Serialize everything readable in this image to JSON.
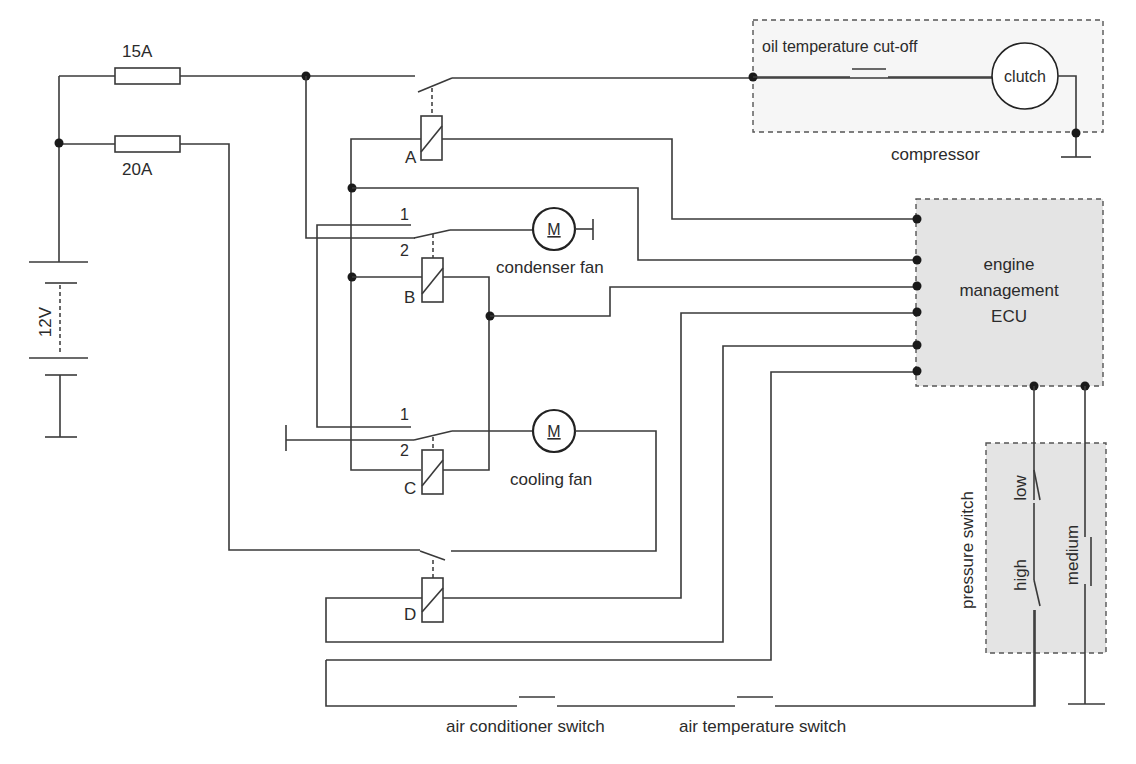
{
  "diagram": {
    "type": "wiring-schematic"
  },
  "power": {
    "battery_label": "12V",
    "fuse_1_label": "15A",
    "fuse_2_label": "20A"
  },
  "relays": {
    "a_label": "A",
    "b_label": "B",
    "c_label": "C",
    "d_label": "D",
    "b_contact_1": "1",
    "b_contact_2": "2",
    "c_contact_1": "1",
    "c_contact_2": "2"
  },
  "motors": {
    "symbol": "M",
    "condenser_fan_label": "condenser fan",
    "cooling_fan_label": "cooling fan"
  },
  "compressor": {
    "label": "compressor",
    "oil_cutoff_label": "oil temperature cut-off",
    "clutch_label": "clutch"
  },
  "ecu": {
    "line1": "engine",
    "line2": "management",
    "line3": "ECU"
  },
  "pressure_switch": {
    "label": "pressure switch",
    "low_label": "low",
    "high_label": "high",
    "medium_label": "medium"
  },
  "switches": {
    "ac_switch_label": "air conditioner switch",
    "air_temp_switch_label": "air temperature switch"
  },
  "colors": {
    "wire": "#3a3a3a",
    "box_fill": "#e4e4e4",
    "background": "#ffffff"
  }
}
